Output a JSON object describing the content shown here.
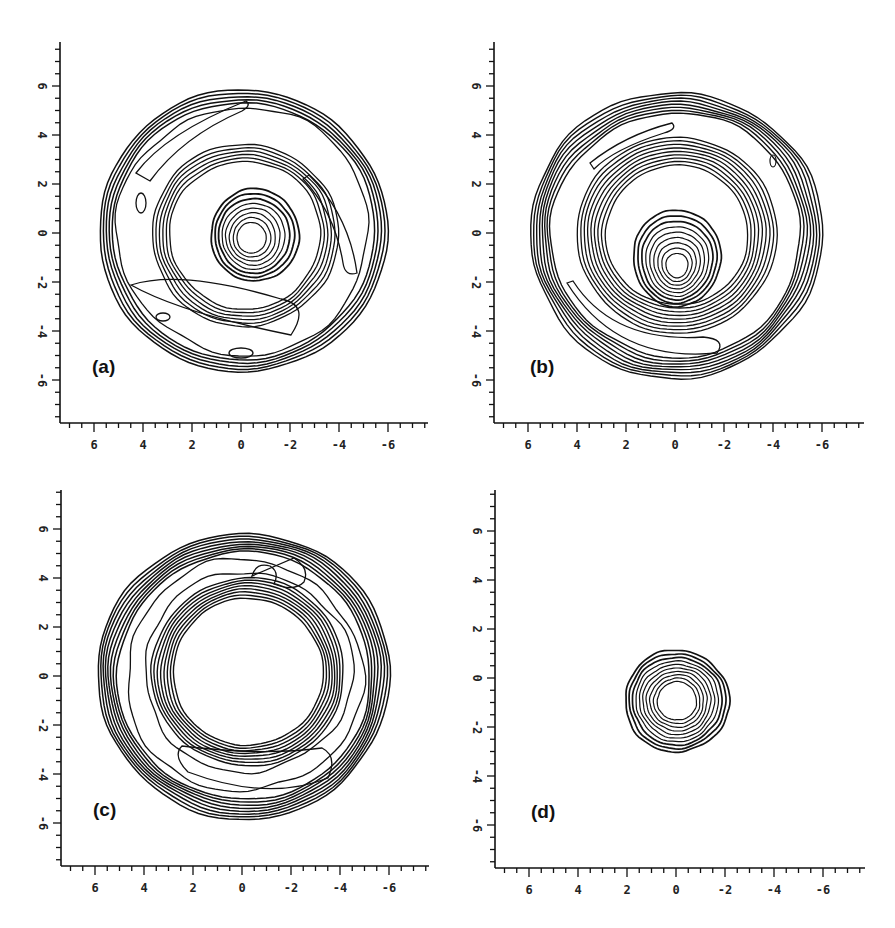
{
  "figure": {
    "panels": [
      {
        "id": "a",
        "label": "(a)",
        "left": 0,
        "top": 0,
        "axis_x0": 60,
        "axis_ytop": 42,
        "axis_y0": 423,
        "axis_xend": 428
      },
      {
        "id": "b",
        "label": "(b)",
        "left": 434,
        "top": 0,
        "axis_x0": 60,
        "axis_ytop": 42,
        "axis_y0": 423,
        "axis_xend": 430
      },
      {
        "id": "c",
        "label": "(c)",
        "left": 1,
        "top": 444,
        "axis_x0": 60,
        "axis_ytop": 46,
        "axis_y0": 422,
        "axis_xend": 428
      },
      {
        "id": "d",
        "label": "(d)",
        "left": 435,
        "top": 445,
        "axis_x0": 60,
        "axis_ytop": 45,
        "axis_y0": 423,
        "axis_xend": 430
      }
    ],
    "axis": {
      "x_tick_labels": [
        "6",
        "4",
        "2",
        "0",
        "-2",
        "-4",
        "-6"
      ],
      "y_tick_labels": [
        "6",
        "4",
        "2",
        "0",
        "-2",
        "-4",
        "-6"
      ],
      "x_range": [
        7.5,
        -7.5
      ],
      "y_range": [
        -7.5,
        7.5
      ]
    }
  },
  "chart_data": [
    {
      "type": "contour",
      "title": "(a)",
      "xlabel": "",
      "ylabel": "",
      "x_ticks": [
        6,
        4,
        2,
        0,
        -2,
        -4,
        -6
      ],
      "y_ticks": [
        6,
        4,
        2,
        0,
        -2,
        -4,
        -6
      ],
      "xlim": [
        7.5,
        -7.5
      ],
      "ylim": [
        -7.5,
        7.5
      ],
      "grid": false,
      "description": "Outer ring of radius ~6 around a spiral inner band (~radius 3.5) that connects to a central peak near (−0.5, 0) with many closely spaced contours."
    },
    {
      "type": "contour",
      "title": "(b)",
      "xlabel": "",
      "ylabel": "",
      "x_ticks": [
        6,
        4,
        2,
        0,
        -2,
        -4,
        -6
      ],
      "y_ticks": [
        6,
        4,
        2,
        0,
        -2,
        -4,
        -6
      ],
      "xlim": [
        7.5,
        -7.5
      ],
      "ylim": [
        -7.5,
        7.5
      ],
      "grid": false,
      "description": "Outer ring radius ~6, inner ring radius ~3.5, and central peak near (0, −1) with egg-shaped concentric contours."
    },
    {
      "type": "contour",
      "title": "(c)",
      "xlabel": "",
      "ylabel": "",
      "x_ticks": [
        6,
        4,
        2,
        0,
        -2,
        -4,
        -6
      ],
      "y_ticks": [
        6,
        4,
        2,
        0,
        -2,
        -4,
        -6
      ],
      "xlim": [
        7.5,
        -7.5
      ],
      "ylim": [
        -7.5,
        7.5
      ],
      "grid": false,
      "description": "Annulus: outer boundary radius ~6, inner boundary radius ~3.5 centered near (0.2, 0); empty central region."
    },
    {
      "type": "contour",
      "title": "(d)",
      "xlabel": "",
      "ylabel": "",
      "x_ticks": [
        6,
        4,
        2,
        0,
        -2,
        -4,
        -6
      ],
      "y_ticks": [
        6,
        4,
        2,
        0,
        -2,
        -4,
        -6
      ],
      "xlim": [
        7.5,
        -7.5
      ],
      "ylim": [
        -7.5,
        7.5
      ],
      "grid": false,
      "description": "Single compact peak centered near (0, −1) with radius ~2 and ~9 concentric contour levels."
    }
  ]
}
